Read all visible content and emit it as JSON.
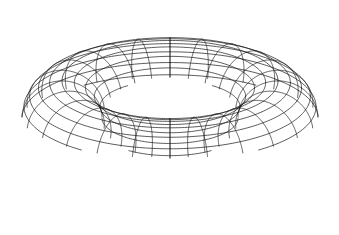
{
  "figure": {
    "shape_name": "torus",
    "render_style": "hidden-line-removed wireframe",
    "background_color": "#ffffff",
    "line_color": "#1a1a1a",
    "line_width": 0.7,
    "canvas": {
      "width": 339,
      "height": 235
    },
    "bounding_box": {
      "x_min": 22,
      "y_min": 15,
      "x_max": 318,
      "y_max": 220
    },
    "inner_hole": {
      "center_x": 170,
      "center_y": 118,
      "radius_x": 73,
      "radius_y": 37
    },
    "geometry": {
      "center_x": 170,
      "center_y": 118,
      "major_radius": 108,
      "minor_radius": 40,
      "meridian_count": 24,
      "parallel_count": 20,
      "projection": "orthographic",
      "elevation_deg": 22,
      "azimuth_deg": 0,
      "y_scale": 0.42
    }
  }
}
